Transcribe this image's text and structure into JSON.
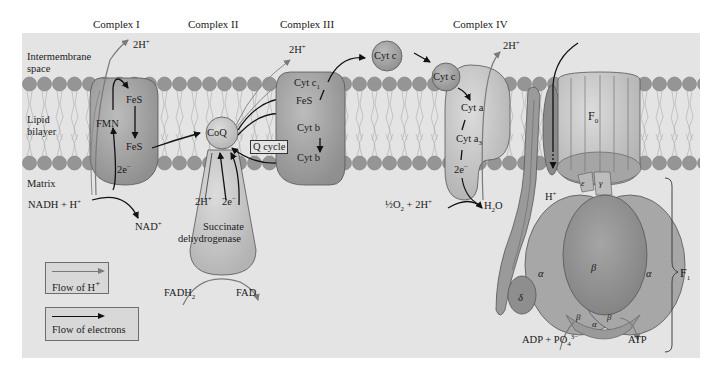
{
  "figure": {
    "colors": {
      "panel_bg": "#e4e4e4",
      "membrane_head": "#9a9a9a",
      "protein_fill": "#a9a9a9",
      "protein_dark": "#8c8c8c",
      "protein_light": "#c6c6c6",
      "proton_arrow": "#7a7a7a",
      "electron_arrow": "#111111"
    },
    "complex_titles": {
      "complex1": "Complex I",
      "complex2": "Complex II",
      "complex3": "Complex III",
      "complex4": "Complex IV"
    },
    "region_labels": {
      "intermembrane_line1": "Intermembrane",
      "intermembrane_line2": "space",
      "bilayer_line1": "Lipid",
      "bilayer_line2": "bilayer",
      "matrix": "Matrix"
    },
    "complex1": {
      "proton_out": "2H",
      "proton_out_sup": "+",
      "fes_top": "FeS",
      "fes_bottom": "FeS",
      "fmn": "FMN",
      "electrons": "2e",
      "electrons_sup": "−",
      "substrate": "NADH + H",
      "substrate_sup": "+",
      "product": "NAD",
      "product_sup": "+"
    },
    "complex2": {
      "coq": "CoQ",
      "protons": "2H",
      "protons_sup": "+",
      "electrons": "2e",
      "electrons_sup": "−",
      "enzyme_line1": "Succinate",
      "enzyme_line2": "dehydrogenase",
      "substrate": "FADH",
      "substrate_sub": "2",
      "product": "FAD"
    },
    "complex3": {
      "proton_out": "2H",
      "proton_out_sup": "+",
      "cyt_c1": "Cyt c",
      "cyt_c1_sub": "1",
      "fes": "FeS",
      "cyt_b_top": "Cyt b",
      "cyt_b_bottom": "Cyt b",
      "q_cycle": "Q cycle"
    },
    "cytochrome_c": {
      "free": "Cyt c",
      "bound": "Cyt c"
    },
    "complex4": {
      "proton_out": "2H",
      "proton_out_sup": "+",
      "cyt_a": "Cyt a",
      "cyt_a3": "Cyt a",
      "cyt_a3_sub": "3",
      "electrons": "2e",
      "electrons_sup": "−",
      "substrate_frac": "½",
      "substrate_o2": "O",
      "substrate_o2_sub": "2",
      "substrate_rest": " + 2H",
      "substrate_rest_sup": "+",
      "product": "H",
      "product_sub": "2",
      "product_o": "O"
    },
    "atp_synthase": {
      "f0": "F",
      "f0_sub": "0",
      "f1": "F",
      "f1_sub": "1",
      "proton_in": "H",
      "proton_in_sup": "+",
      "epsilon": "ε",
      "gamma": "γ",
      "delta": "δ",
      "alpha_left": "α",
      "alpha_right": "α",
      "alpha_bottom": "α",
      "beta_center": "β",
      "beta_bottom_left": "β",
      "beta_bottom_right": "β",
      "substrate": "ADP + PO",
      "substrate_sub": "4",
      "substrate_sup": "3−",
      "product": "ATP"
    },
    "legend": {
      "proton_flow": "Flow of H",
      "proton_flow_sup": "+",
      "electron_flow": "Flow of electrons"
    }
  }
}
